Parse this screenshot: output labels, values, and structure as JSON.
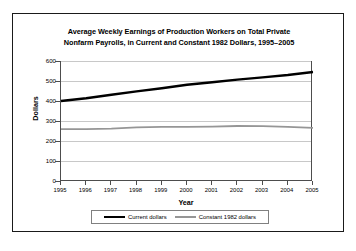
{
  "chart_data": {
    "type": "line",
    "title": "Average Weekly Earnings of Production Workers on Total Private Nonfarm Payrolls, in Current and Constant 1982 Dollars, 1995–2005",
    "title_line1": "Average Weekly Earnings of Production Workers on Total Private",
    "title_line2": "Nonfarm Payrolls, in Current and Constant 1982 Dollars, 1995–2005",
    "xlabel": "Year",
    "ylabel": "Dollars",
    "categories": [
      1995,
      1996,
      1997,
      1998,
      1999,
      2000,
      2001,
      2002,
      2003,
      2004,
      2005
    ],
    "xtick_labels": [
      "1995",
      "1996",
      "1997",
      "1998",
      "1999",
      "2000",
      "2001",
      "2002",
      "2003",
      "2004",
      "2005"
    ],
    "ylim": [
      0,
      600
    ],
    "yticks": [
      0,
      100,
      200,
      300,
      400,
      500,
      600
    ],
    "ytick_labels": [
      "0",
      "100",
      "200",
      "300",
      "400",
      "500",
      "600"
    ],
    "grid": true,
    "legend_position": "bottom",
    "series": [
      {
        "name": "Current dollars",
        "color": "#000000",
        "width": 2.4,
        "values": [
          400,
          414,
          431,
          448,
          464,
          481,
          494,
          507,
          518,
          530,
          545
        ]
      },
      {
        "name": "Constant 1982 dollars",
        "color": "#969696",
        "width": 1.8,
        "values": [
          259,
          259,
          262,
          268,
          271,
          271,
          272,
          275,
          274,
          271,
          266
        ]
      }
    ]
  },
  "legend": {
    "items": [
      {
        "label": "Current dollars"
      },
      {
        "label": "Constant 1982 dollars"
      }
    ]
  },
  "colors": {
    "current_dollars": "#000000",
    "constant_dollars": "#969696",
    "gridline": "#c8c8c8",
    "axis": "#4d4d4d",
    "frame": "#1a1a1a"
  }
}
